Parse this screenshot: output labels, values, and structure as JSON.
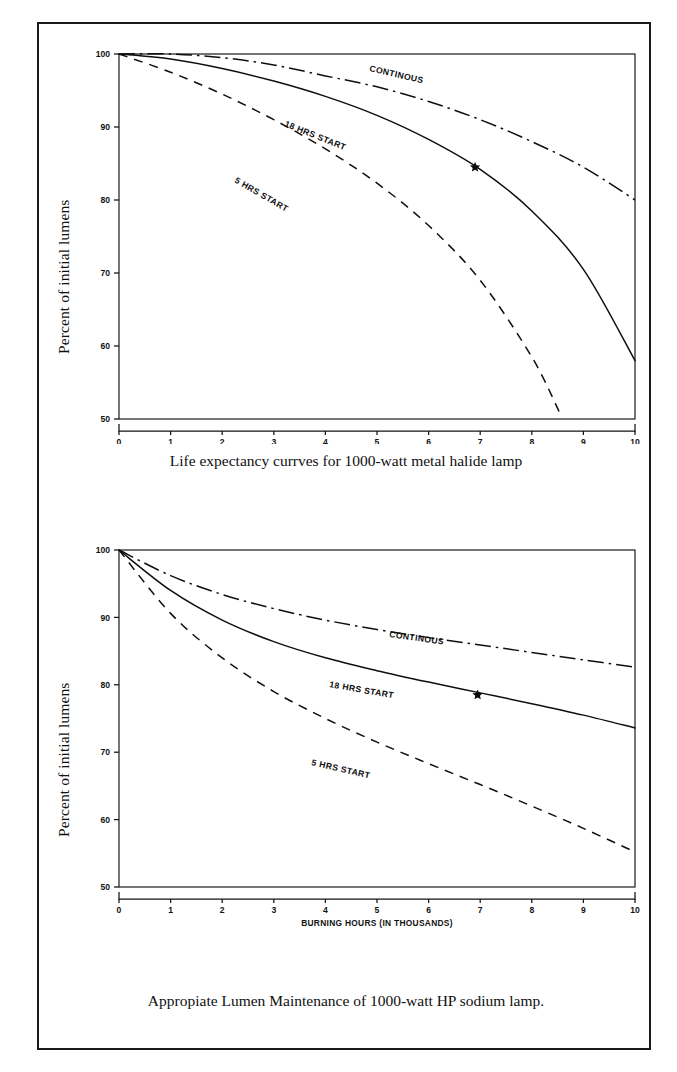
{
  "figure": {
    "background": "#ffffff",
    "ink_color": "#111111",
    "border": "outer-rectangle"
  },
  "charts": [
    {
      "id": "metal-halide",
      "caption": "Life expectancy currves for 1000-watt metal halide lamp",
      "ylabel": "Percent of initial lumens",
      "xlabel": "BURNING HOURS (IN THOUSANDS)",
      "xticks": [
        "0",
        "1",
        "2",
        "3",
        "4",
        "5",
        "6",
        "7",
        "8",
        "9",
        "10"
      ],
      "yticks": [
        "50",
        "60",
        "70",
        "80",
        "90",
        "100"
      ],
      "series_labels": [
        "CONTINOUS",
        "18 HRS START",
        "5 HRS START"
      ],
      "marker": "star"
    },
    {
      "id": "hp-sodium",
      "caption": "Appropiate Lumen Maintenance of 1000-watt HP sodium lamp.",
      "ylabel": "Percent of initial lumens",
      "xlabel": "BURNING HOURS (IN THOUSANDS)",
      "xticks": [
        "0",
        "1",
        "2",
        "3",
        "4",
        "5",
        "6",
        "7",
        "8",
        "9",
        "10"
      ],
      "yticks": [
        "50",
        "60",
        "70",
        "80",
        "90",
        "100"
      ],
      "series_labels": [
        "CONTINOUS",
        "18 HRS START",
        "5 HRS START"
      ],
      "marker": "star"
    }
  ],
  "chart_data": [
    {
      "type": "line",
      "title": "Life expectancy currves for 1000-watt metal halide lamp",
      "xlabel": "BURNING HOURS (IN THOUSANDS)",
      "ylabel": "Percent of initial lumens",
      "xlim": [
        0,
        10
      ],
      "ylim": [
        50,
        100
      ],
      "xticks": [
        0,
        1,
        2,
        3,
        4,
        5,
        6,
        7,
        8,
        9,
        10
      ],
      "yticks": [
        50,
        60,
        70,
        80,
        90,
        100
      ],
      "grid": false,
      "legend": "inline-curve-labels",
      "x": [
        0,
        1,
        2,
        3,
        4,
        5,
        6,
        7,
        8,
        9,
        10
      ],
      "series": [
        {
          "name": "CONTINOUS",
          "style": "dash-dot",
          "values": [
            100,
            100,
            99.5,
            98.5,
            97,
            95.5,
            93.5,
            91,
            88,
            84.5,
            80
          ]
        },
        {
          "name": "18 HRS START",
          "style": "solid",
          "values": [
            100,
            99.3,
            98,
            96.3,
            94.2,
            91.6,
            88.3,
            84.2,
            78.5,
            70.5,
            58
          ]
        },
        {
          "name": "5 HRS START",
          "style": "dashed",
          "values": [
            100,
            97.5,
            94.5,
            91,
            87,
            82.3,
            76.5,
            69,
            58.5,
            null,
            null
          ]
        }
      ],
      "annotations": [
        {
          "label": "star-marker",
          "series": "18 HRS START",
          "x": 6.9,
          "y": 84.5
        }
      ]
    },
    {
      "type": "line",
      "title": "Appropiate Lumen Maintenance of 1000-watt HP sodium lamp.",
      "xlabel": "BURNING HOURS (IN THOUSANDS)",
      "ylabel": "Percent of initial lumens",
      "xlim": [
        0,
        10
      ],
      "ylim": [
        50,
        100
      ],
      "xticks": [
        0,
        1,
        2,
        3,
        4,
        5,
        6,
        7,
        8,
        9,
        10
      ],
      "yticks": [
        50,
        60,
        70,
        80,
        90,
        100
      ],
      "grid": false,
      "legend": "inline-curve-labels",
      "x": [
        0,
        1,
        2,
        3,
        4,
        5,
        6,
        7,
        8,
        9,
        10
      ],
      "series": [
        {
          "name": "CONTINOUS",
          "style": "dash-dot",
          "values": [
            100,
            96.2,
            93.4,
            91.3,
            89.6,
            88.2,
            87.0,
            85.9,
            84.8,
            83.7,
            82.6
          ]
        },
        {
          "name": "18 HRS START",
          "style": "solid",
          "values": [
            100,
            94.0,
            89.6,
            86.4,
            84.0,
            82.1,
            80.4,
            78.8,
            77.2,
            75.5,
            73.6
          ]
        },
        {
          "name": "5 HRS START",
          "style": "dashed",
          "values": [
            100,
            90.6,
            84.0,
            79.0,
            75.0,
            71.5,
            68.3,
            65.2,
            62.0,
            58.7,
            55.2
          ]
        }
      ],
      "annotations": [
        {
          "label": "star-marker",
          "series": "18 HRS START",
          "x": 6.95,
          "y": 78.5
        }
      ]
    }
  ]
}
